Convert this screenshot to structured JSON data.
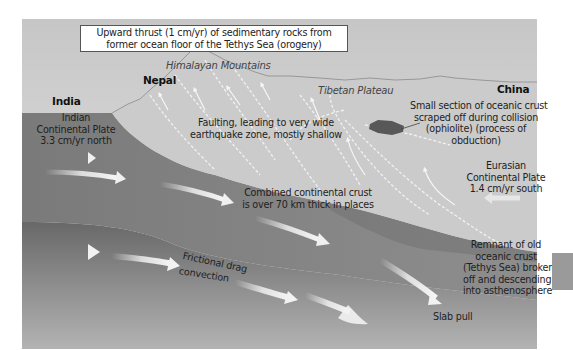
{
  "title_box": {
    "line1": "Upward thrust (1 cm/yr) of sedimentary rocks from",
    "line2": "former ocean floor of the Tethys Sea (orogeny)"
  },
  "regions": {
    "india": "India",
    "nepal": "Nepal",
    "china": "China",
    "himalayan_mountains": "Himalayan Mountains",
    "tibetan_plateau": "Tibetan Plateau"
  },
  "labels": {
    "indian_plate": [
      "Indian",
      "Continental Plate",
      "3.3 cm/yr north"
    ],
    "faulting": [
      "Faulting, leading to very wide",
      "earthquake zone, mostly shallow"
    ],
    "ophiolite": [
      "Small section of oceanic crust",
      "scraped off during collision",
      "(ophiolite) (process of",
      "obduction)"
    ],
    "eurasian_plate": [
      "Eurasian",
      "Continental Plate",
      "1.4 cm/yr south"
    ],
    "combined_crust": [
      "Combined continental crust",
      "is over 70 km thick in places"
    ],
    "frictional_drag": "Frictional drag",
    "convection": "convection",
    "remnant": [
      "Remnant of old",
      "oceanic crust",
      "(Tethys Sea) broken",
      "off and descending",
      "into asthenosphere"
    ],
    "slab_pull": "Slab pull"
  },
  "colors": {
    "sky_top": "#c4c4c4",
    "sky_bottom": "#e6e6e6",
    "eurasian_crust": "#c9c9c9",
    "indian_plate": "#7c7c7c",
    "lower_mantle_top": "#6a6a6a",
    "lower_mantle_bottom": "#b0b0b0",
    "arrow": "#f2f2f2",
    "ophiolite": "#555555",
    "side_tab": "#9a9a9a"
  }
}
